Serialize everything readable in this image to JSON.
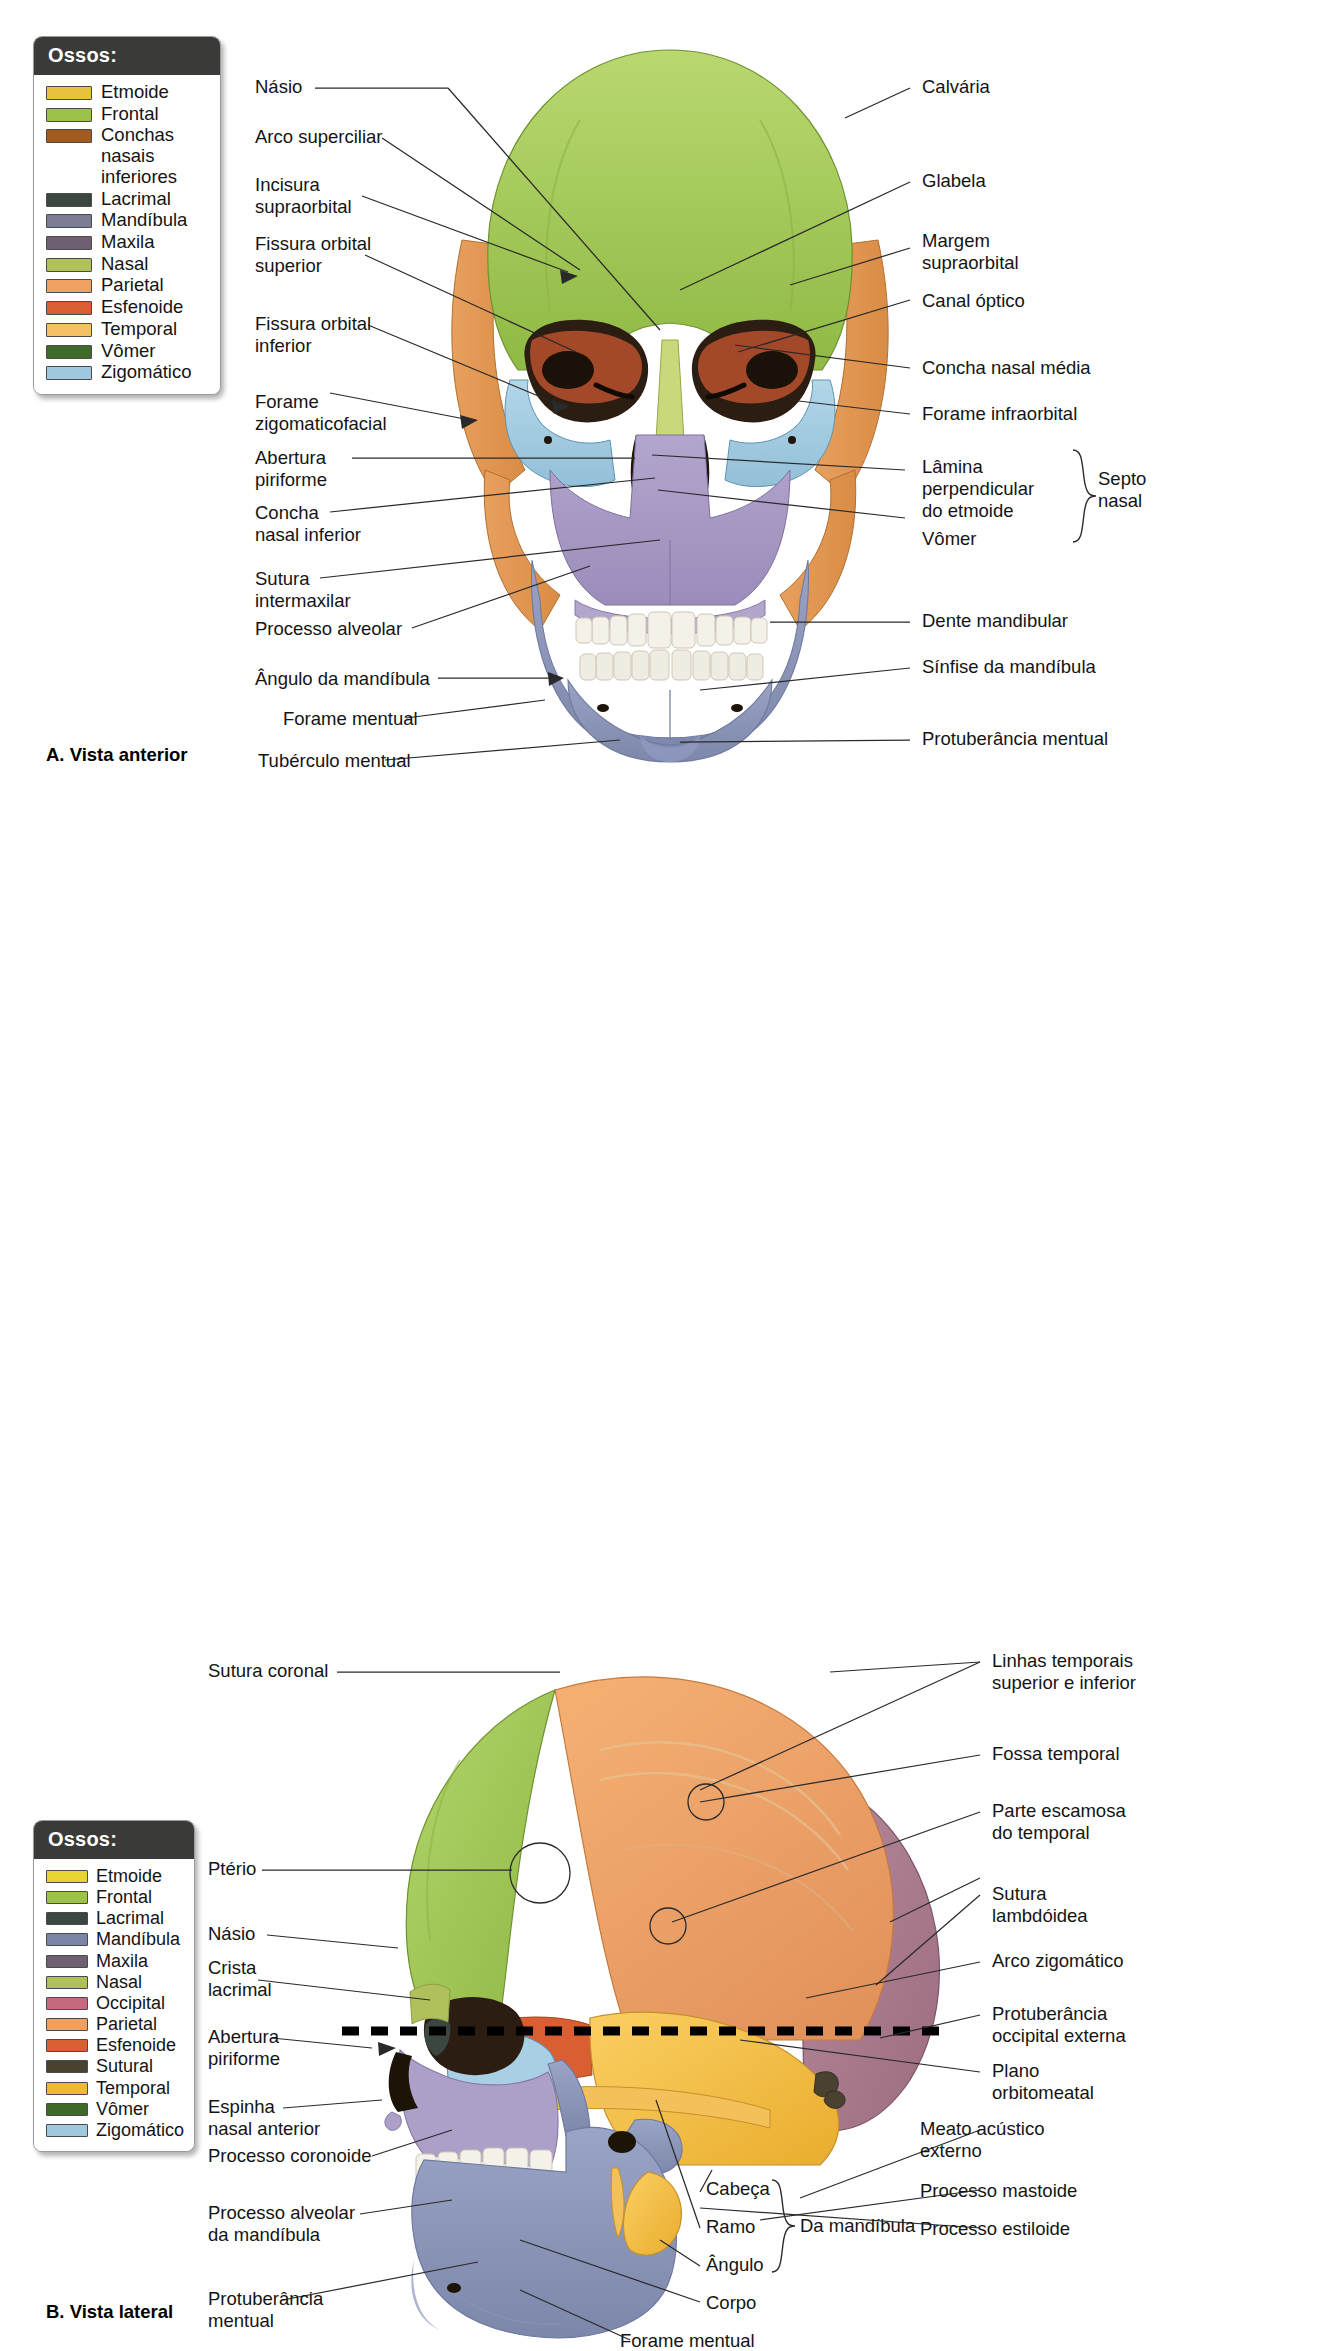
{
  "figure": {
    "panels": [
      {
        "id": "A",
        "caption": "A. Vista anterior"
      },
      {
        "id": "B",
        "caption": "B. Vista lateral"
      }
    ]
  },
  "legend_anterior": {
    "title": "Ossos:",
    "items": [
      {
        "label": "Etmoide",
        "color": "#e8c23d"
      },
      {
        "label": "Frontal",
        "color": "#9cc24a"
      },
      {
        "label": "Conchas nasais\ninferiores",
        "color": "#a35a1e"
      },
      {
        "label": "Lacrimal",
        "color": "#3c4641"
      },
      {
        "label": "Mandíbula",
        "color": "#7b7b96"
      },
      {
        "label": "Maxila",
        "color": "#6e5f73"
      },
      {
        "label": "Nasal",
        "color": "#b0c05a"
      },
      {
        "label": "Parietal",
        "color": "#f0a060"
      },
      {
        "label": "Esfenoide",
        "color": "#d95f33"
      },
      {
        "label": "Temporal",
        "color": "#f6c165"
      },
      {
        "label": "Vômer",
        "color": "#3f6b2a"
      },
      {
        "label": "Zigomático",
        "color": "#9fc8de"
      }
    ]
  },
  "legend_lateral": {
    "title": "Ossos:",
    "items": [
      {
        "label": "Etmoide",
        "color": "#e8d42e"
      },
      {
        "label": "Frontal",
        "color": "#9cc24a"
      },
      {
        "label": "Lacrimal",
        "color": "#3c4641"
      },
      {
        "label": "Mandíbula",
        "color": "#7b85a8"
      },
      {
        "label": "Maxila",
        "color": "#6e5f73"
      },
      {
        "label": "Nasal",
        "color": "#b0c05a"
      },
      {
        "label": "Occipital",
        "color": "#c56a7e"
      },
      {
        "label": "Parietal",
        "color": "#f0a060"
      },
      {
        "label": "Esfenoide",
        "color": "#d95f33"
      },
      {
        "label": "Sutural",
        "color": "#4a4231"
      },
      {
        "label": "Temporal",
        "color": "#f1b92e"
      },
      {
        "label": "Vômer",
        "color": "#3f6b2a"
      },
      {
        "label": "Zigomático",
        "color": "#9fc8de"
      }
    ]
  },
  "anterior_labels_left": [
    {
      "key": "nasio",
      "text": "Násio"
    },
    {
      "key": "arco-superciliar",
      "text": "Arco superciliar"
    },
    {
      "key": "incisura-supraorbital",
      "text": "Incisura\nsupraorbital"
    },
    {
      "key": "fissura-orbital-superior",
      "text": "Fissura orbital\nsuperior"
    },
    {
      "key": "fissura-orbital-inferior",
      "text": "Fissura orbital\ninferior"
    },
    {
      "key": "forame-zigomaticofacial",
      "text": "Forame\nzigomaticofacial"
    },
    {
      "key": "abertura-piriforme",
      "text": "Abertura\npiriforme"
    },
    {
      "key": "concha-nasal-inferior",
      "text": "Concha\nnasal inferior"
    },
    {
      "key": "sutura-intermaxilar",
      "text": "Sutura\nintermaxilar"
    },
    {
      "key": "processo-alveolar",
      "text": "Processo alveolar"
    },
    {
      "key": "angulo-da-mandibula",
      "text": "Ângulo da mandíbula"
    },
    {
      "key": "forame-mentual",
      "text": "Forame mentual"
    },
    {
      "key": "tuberculo-mentual",
      "text": "Tubérculo mentual"
    }
  ],
  "anterior_labels_right": [
    {
      "key": "calvaria",
      "text": "Calvária"
    },
    {
      "key": "glabela",
      "text": "Glabela"
    },
    {
      "key": "margem-supraorbital",
      "text": "Margem\nsupraorbital"
    },
    {
      "key": "canal-optico",
      "text": "Canal óptico"
    },
    {
      "key": "concha-nasal-media",
      "text": "Concha nasal média"
    },
    {
      "key": "forame-infraorbital",
      "text": "Forame infraorbital"
    },
    {
      "key": "lamina-perpendicular",
      "text": "Lâmina\nperpendicular\ndo etmoide"
    },
    {
      "key": "vomer",
      "text": "Vômer"
    },
    {
      "key": "septo-nasal",
      "text": "Septo\nnasal"
    },
    {
      "key": "dente-mandibular",
      "text": "Dente mandibular"
    },
    {
      "key": "sinfise-da-mandibula",
      "text": "Sínfise da mandíbula"
    },
    {
      "key": "protuberancia-mentual",
      "text": "Protuberância mentual"
    }
  ],
  "lateral_labels_left": [
    {
      "key": "sutura-coronal",
      "text": "Sutura coronal"
    },
    {
      "key": "pterio",
      "text": "Ptério"
    },
    {
      "key": "nasio",
      "text": "Násio"
    },
    {
      "key": "crista-lacrimal",
      "text": "Crista\nlacrimal"
    },
    {
      "key": "abertura-piriforme",
      "text": "Abertura\npiriforme"
    },
    {
      "key": "espinha-nasal-anterior",
      "text": "Espinha\nnasal anterior"
    },
    {
      "key": "processo-coronoide",
      "text": "Processo coronoide"
    },
    {
      "key": "processo-alveolar-da-mandibula",
      "text": "Processo alveolar\nda mandíbula"
    },
    {
      "key": "protuberancia-mentual",
      "text": "Protuberância\nmentual"
    }
  ],
  "lateral_labels_right": [
    {
      "key": "linhas-temporais",
      "text": "Linhas temporais\nsuperior e inferior"
    },
    {
      "key": "fossa-temporal",
      "text": "Fossa temporal"
    },
    {
      "key": "parte-escamosa-do-temporal",
      "text": "Parte escamosa\ndo temporal"
    },
    {
      "key": "sutura-lambdoidea",
      "text": "Sutura\nlambdóidea"
    },
    {
      "key": "arco-zigomatico",
      "text": "Arco zigomático"
    },
    {
      "key": "protuberancia-occipital-externa",
      "text": "Protuberância\noccipital externa"
    },
    {
      "key": "plano-orbitomeatal",
      "text": "Plano\norbitomeatal"
    },
    {
      "key": "meato-acustico-externo",
      "text": "Meato acústico\nexterno"
    },
    {
      "key": "processo-mastoide",
      "text": "Processo mastoide"
    },
    {
      "key": "processo-estiloide",
      "text": "Processo estiloide"
    }
  ],
  "lateral_mandible_group": {
    "bracket_label": "Da mandíbula",
    "items": [
      {
        "key": "cabeca",
        "text": "Cabeça"
      },
      {
        "key": "ramo",
        "text": "Ramo"
      },
      {
        "key": "angulo",
        "text": "Ângulo"
      },
      {
        "key": "corpo",
        "text": "Corpo"
      }
    ],
    "extra": {
      "key": "forame-mentual",
      "text": "Forame mentual"
    }
  },
  "colors": {
    "frontal": "#9cc24a",
    "parietal": "#f0a060",
    "temporal": "#f1b92e",
    "occipital": "#a8788c",
    "sphenoid": "#d95f33",
    "zygomatic": "#9fc8de",
    "maxilla": "#a79bc0",
    "mandible": "#8c95b8",
    "nasal": "#b0c05a",
    "vomer": "#3f6b2a",
    "ethmoid": "#e8d42e",
    "lacrimal": "#3c4641",
    "teeth": "#f2efe6",
    "orbit_dark": "#2a1d12",
    "leader": "#2a2a2a"
  }
}
